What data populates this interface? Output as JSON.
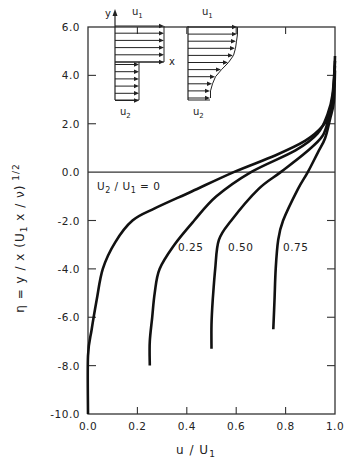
{
  "chart_data": {
    "type": "line",
    "title": "",
    "xlabel": "u / U1",
    "ylabel": "η = y / x (U1 x / ν)^1/2",
    "xlim": [
      0.0,
      1.0
    ],
    "ylim": [
      -10.0,
      6.0
    ],
    "grid": false,
    "x_ticks": [
      "0.0",
      "0.2",
      "0.4",
      "0.6",
      "0.8",
      "1.0"
    ],
    "x_tick_values": [
      0.0,
      0.2,
      0.4,
      0.6,
      0.8,
      1.0
    ],
    "y_ticks": [
      "6.0",
      "4.0",
      "2.0",
      "0.0",
      "-2.0",
      "-4.0",
      "-6.0",
      "-8.0",
      "-10.0"
    ],
    "y_tick_values": [
      6,
      4,
      2,
      0,
      -2,
      -4,
      -6,
      -8,
      -10
    ],
    "reference_line": {
      "eta": 0.0
    },
    "series": [
      {
        "name": "U2/U1 = 0",
        "label": "U2 / U1 = 0",
        "points": [
          [
            1.0,
            4.8
          ],
          [
            0.995,
            3.5
          ],
          [
            0.98,
            2.5
          ],
          [
            0.95,
            1.9
          ],
          [
            0.88,
            1.3
          ],
          [
            0.76,
            0.7
          ],
          [
            0.59,
            0.0
          ],
          [
            0.42,
            -0.8
          ],
          [
            0.27,
            -1.5
          ],
          [
            0.18,
            -2.0
          ],
          [
            0.11,
            -2.9
          ],
          [
            0.06,
            -4.0
          ],
          [
            0.035,
            -5.3
          ],
          [
            0.015,
            -6.5
          ],
          [
            0.0,
            -7.6
          ],
          [
            0.0,
            -10.0
          ]
        ]
      },
      {
        "name": "U2/U1 = 0.25",
        "label": "0.25",
        "points": [
          [
            1.0,
            4.6
          ],
          [
            0.99,
            3.2
          ],
          [
            0.97,
            2.4
          ],
          [
            0.93,
            1.6
          ],
          [
            0.84,
            0.9
          ],
          [
            0.66,
            0.0
          ],
          [
            0.52,
            -1.0
          ],
          [
            0.43,
            -2.0
          ],
          [
            0.35,
            -3.0
          ],
          [
            0.29,
            -4.0
          ],
          [
            0.27,
            -5.0
          ],
          [
            0.26,
            -6.0
          ],
          [
            0.25,
            -7.0
          ],
          [
            0.25,
            -8.0
          ]
        ]
      },
      {
        "name": "U2/U1 = 0.50",
        "label": "0.50",
        "points": [
          [
            1.0,
            4.4
          ],
          [
            0.99,
            3.0
          ],
          [
            0.975,
            2.3
          ],
          [
            0.95,
            1.5
          ],
          [
            0.88,
            0.8
          ],
          [
            0.78,
            0.0
          ],
          [
            0.69,
            -0.7
          ],
          [
            0.58,
            -2.0
          ],
          [
            0.53,
            -2.8
          ],
          [
            0.515,
            -4.0
          ],
          [
            0.505,
            -5.3
          ],
          [
            0.5,
            -6.3
          ],
          [
            0.5,
            -7.3
          ]
        ]
      },
      {
        "name": "U2/U1 = 0.75",
        "label": "0.75",
        "points": [
          [
            1.0,
            4.2
          ],
          [
            0.995,
            2.9
          ],
          [
            0.98,
            2.2
          ],
          [
            0.96,
            1.4
          ],
          [
            0.93,
            0.8
          ],
          [
            0.89,
            0.0
          ],
          [
            0.85,
            -0.7
          ],
          [
            0.79,
            -2.0
          ],
          [
            0.77,
            -2.8
          ],
          [
            0.76,
            -4.0
          ],
          [
            0.755,
            -5.3
          ],
          [
            0.75,
            -6.5
          ]
        ]
      }
    ],
    "annotations": [
      "U2 / U1 = 0",
      "0.25",
      "0.50",
      "0.75"
    ],
    "insets": [
      {
        "name": "step-initial-profile",
        "labels": {
          "y": "y",
          "u1": "u1",
          "x": "x",
          "u2": "u2"
        },
        "arrows_upper": 6,
        "arrows_lower": 6
      },
      {
        "name": "mixed-profile",
        "labels": {
          "u1": "u1",
          "u2": "u2"
        },
        "arrows": 11
      }
    ]
  },
  "labels": {
    "xlabel_main": "u / U",
    "xlabel_sub": "1",
    "ylabel_text": "η = y / x (U",
    "ylabel_sub": "1",
    "ylabel_text2": " x / ν)",
    "ylabel_sup": " 1/2",
    "legend_u2": "U",
    "legend_u2_sub": "2",
    "legend_mid": " / U",
    "legend_u1_sub": "1",
    "legend_end": " = 0",
    "inset1_y": "y",
    "inset1_u": "u",
    "inset1_u_sub": "1",
    "inset1_x": "x",
    "inset1_u2": "u",
    "inset1_u2_sub": "2",
    "inset2_u": "u",
    "inset2_u_sub": "1",
    "inset2_u2": "u",
    "inset2_u2_sub": "2",
    "curve_025": "0.25",
    "curve_050": "0.50",
    "curve_075": "0.75"
  }
}
